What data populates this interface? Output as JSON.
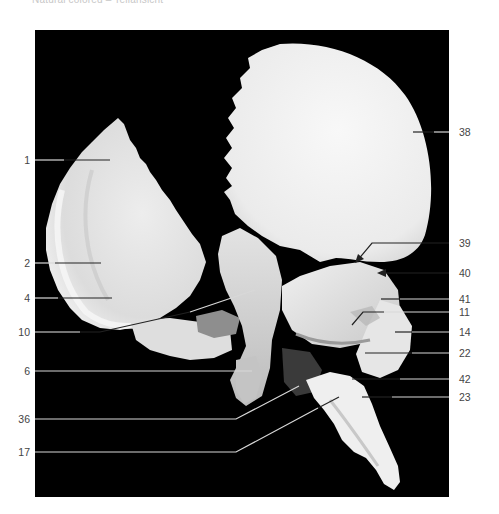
{
  "caption": "Natural colored – Teilansicht",
  "panel": {
    "x": 35,
    "y": 30,
    "width": 414,
    "height": 467,
    "background": "#000000"
  },
  "colors": {
    "bone": "#ececec",
    "bone_shadow": "#cfcfcf",
    "bone_dark": "#8a8a8a",
    "leader_light": "#d8d8d8",
    "leader_dark": "#222222",
    "label_text": "#444444"
  },
  "labels_left": [
    {
      "text": "1",
      "y": 160,
      "line_end_x": 110,
      "line_end_y": 160
    },
    {
      "text": "2",
      "y": 263,
      "line_end_x": 101,
      "line_end_y": 263
    },
    {
      "text": "4",
      "y": 298,
      "line_end_x": 112,
      "line_end_y": 298
    },
    {
      "text": "10",
      "y": 332,
      "line_end_x": 255,
      "line_end_y": 290,
      "bend_x": 100
    },
    {
      "text": "6",
      "y": 371,
      "line_end_x": 252,
      "line_end_y": 371
    },
    {
      "text": "36",
      "y": 419,
      "line_end_x": 299,
      "line_end_y": 386,
      "bend_x": 236
    },
    {
      "text": "17",
      "y": 452,
      "line_end_x": 339,
      "line_end_y": 397,
      "bend_x": 236
    }
  ],
  "labels_right": [
    {
      "text": "38",
      "y": 132,
      "line_start_x": 413
    },
    {
      "text": "39",
      "y": 243,
      "line_start_x": 372,
      "arrow_to_x": 357,
      "arrow_to_y": 261
    },
    {
      "text": "40",
      "y": 273,
      "line_start_x": 378,
      "arrow": true
    },
    {
      "text": "41",
      "y": 299,
      "line_start_x": 381
    },
    {
      "text": "11",
      "y": 312,
      "line_start_x": 363,
      "diag_to_x": 352,
      "diag_to_y": 325
    },
    {
      "text": "14",
      "y": 332,
      "line_start_x": 395
    },
    {
      "text": "22",
      "y": 353,
      "line_start_x": 365
    },
    {
      "text": "42",
      "y": 379,
      "line_start_x": 352
    },
    {
      "text": "23",
      "y": 397,
      "line_start_x": 362
    }
  ]
}
